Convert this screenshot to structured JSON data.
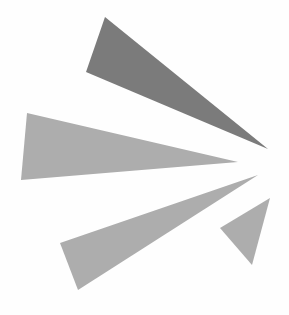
{
  "figure": {
    "background": "#fefefe",
    "rays": [
      {
        "name": "upper-dark-ray",
        "color": "#7b7b7b",
        "points": "105,17 86,72 268,149"
      },
      {
        "name": "middle-large-ray",
        "color": "#adadad",
        "points": "27,113 21,180 238,162"
      },
      {
        "name": "lower-ray",
        "color": "#adadad",
        "points": "60,243 78,290 258,175"
      },
      {
        "name": "small-right-ray",
        "color": "#adadad",
        "points": "270,198 220,228 252,265"
      }
    ]
  }
}
